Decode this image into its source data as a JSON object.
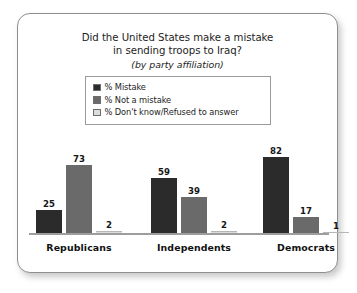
{
  "chart_data": {
    "type": "bar",
    "title": "Did the United States make a mistake in sending troops to Iraq?",
    "title_lines": [
      "Did the United States make a mistake",
      "in sending troops to Iraq?"
    ],
    "subtitle": "(by party affiliation)",
    "xlabel": "",
    "ylabel": "",
    "ylim": [
      0,
      100
    ],
    "grid": false,
    "legend_position": "top-center",
    "categories": [
      "Republicans",
      "Independents",
      "Democrats"
    ],
    "series": [
      {
        "name": "% Mistake",
        "color": "#2b2b2b",
        "values": [
          25,
          59,
          82
        ]
      },
      {
        "name": "% Not a mistake",
        "color": "#6a6a6a",
        "values": [
          73,
          39,
          17
        ]
      },
      {
        "name": "% Don't know/Refused to answer",
        "color": "#dcdcdc",
        "values": [
          2,
          2,
          1
        ]
      }
    ]
  },
  "legend": {
    "entries": [
      {
        "label": "% Mistake",
        "color": "#2b2b2b"
      },
      {
        "label": "% Not a mistake",
        "color": "#6a6a6a"
      },
      {
        "label": "% Don't know/Refused to answer",
        "color": "#dcdcdc"
      }
    ]
  },
  "frame": {
    "border_color": "#8f8f8f",
    "background_color": "#ffffff"
  },
  "axis": {
    "baseline_color": "#9d9d9d"
  }
}
